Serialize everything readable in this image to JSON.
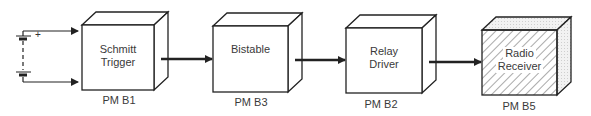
{
  "diagram": {
    "type": "block-diagram",
    "source": {
      "name": "battery",
      "polarity_label": "+"
    },
    "blocks": [
      {
        "id": "b1",
        "line1": "Schmitt",
        "line2": "Trigger",
        "code": "PM B1",
        "hatched": false
      },
      {
        "id": "b2",
        "line1": "Bistable",
        "line2": "",
        "code": "PM B3",
        "hatched": false
      },
      {
        "id": "b3",
        "line1": "Relay",
        "line2": "Driver",
        "code": "PM B2",
        "hatched": false
      },
      {
        "id": "b4",
        "line1": "Radio",
        "line2": "Receiver",
        "code": "PM B5",
        "hatched": true
      }
    ],
    "connections": [
      {
        "from": "battery+",
        "to": "Schmitt Trigger"
      },
      {
        "from": "battery-",
        "to": "Schmitt Trigger"
      },
      {
        "from": "Schmitt Trigger",
        "to": "Bistable"
      },
      {
        "from": "Bistable",
        "to": "Relay Driver"
      },
      {
        "from": "Relay Driver",
        "to": "Radio Receiver"
      }
    ]
  }
}
